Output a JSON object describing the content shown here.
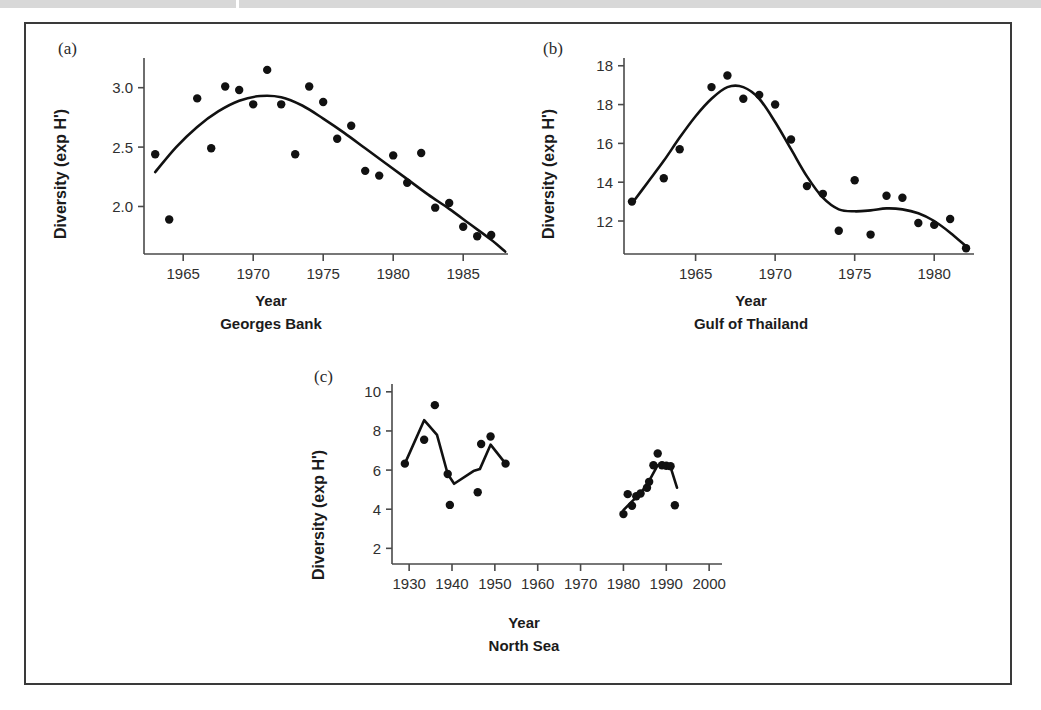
{
  "figure": {
    "panels": [
      "a",
      "b",
      "c"
    ],
    "axis_title": "Year",
    "y_axis_label": "Diversity (exp H')"
  },
  "panel_a": {
    "letter": "(a)",
    "caption": "Georges Bank",
    "xlabel": "Year",
    "ylabel": "Diversity (exp H')",
    "xticks": [
      "1965",
      "1970",
      "1975",
      "1980",
      "1985"
    ],
    "yticks": [
      "3.0",
      "2.5",
      "2.0"
    ]
  },
  "panel_b": {
    "letter": "(b)",
    "caption": "Gulf of Thailand",
    "xlabel": "Year",
    "ylabel": "Diversity (exp H')",
    "xticks": [
      "1965",
      "1970",
      "1975",
      "1980"
    ],
    "yticks": [
      "18",
      "18",
      "16",
      "14",
      "12"
    ]
  },
  "panel_c": {
    "letter": "(c)",
    "caption": "North Sea",
    "xlabel": "Year",
    "ylabel": "Diversity (exp H')",
    "xticks": [
      "1930",
      "1940",
      "1950",
      "1960",
      "1970",
      "1980",
      "1990",
      "2000"
    ],
    "yticks": [
      "10",
      "8",
      "6",
      "4",
      "2"
    ]
  },
  "chart_data": [
    {
      "type": "scatter",
      "id": "panel_a",
      "title": "Georges Bank",
      "panel": "(a)",
      "xlabel": "Year",
      "ylabel": "Diversity (exp H')",
      "xlim": [
        1962.2,
        1988.2
      ],
      "ylim": [
        1.6,
        3.25
      ],
      "xticks": [
        1965,
        1970,
        1975,
        1980,
        1985
      ],
      "yticks": [
        3.0,
        2.5,
        2.0
      ],
      "grid": false,
      "legend": "none",
      "points": [
        {
          "x": 1963,
          "y": 2.44
        },
        {
          "x": 1964,
          "y": 1.89
        },
        {
          "x": 1966,
          "y": 2.91
        },
        {
          "x": 1967,
          "y": 2.49
        },
        {
          "x": 1968,
          "y": 3.01
        },
        {
          "x": 1969,
          "y": 2.98
        },
        {
          "x": 1970,
          "y": 2.86
        },
        {
          "x": 1971,
          "y": 3.15
        },
        {
          "x": 1972,
          "y": 2.86
        },
        {
          "x": 1973,
          "y": 2.44
        },
        {
          "x": 1974,
          "y": 3.01
        },
        {
          "x": 1975,
          "y": 2.88
        },
        {
          "x": 1976,
          "y": 2.57
        },
        {
          "x": 1977,
          "y": 2.68
        },
        {
          "x": 1978,
          "y": 2.3
        },
        {
          "x": 1979,
          "y": 2.26
        },
        {
          "x": 1980,
          "y": 2.43
        },
        {
          "x": 1981,
          "y": 2.2
        },
        {
          "x": 1982,
          "y": 2.45
        },
        {
          "x": 1983,
          "y": 1.99
        },
        {
          "x": 1984,
          "y": 2.03
        },
        {
          "x": 1985,
          "y": 1.83
        },
        {
          "x": 1986,
          "y": 1.75
        },
        {
          "x": 1987,
          "y": 1.76
        }
      ],
      "trend": [
        {
          "x": 1963.0,
          "y": 2.29
        },
        {
          "x": 1964.5,
          "y": 2.5
        },
        {
          "x": 1966.0,
          "y": 2.67
        },
        {
          "x": 1967.5,
          "y": 2.8
        },
        {
          "x": 1969.0,
          "y": 2.89
        },
        {
          "x": 1970.5,
          "y": 2.93
        },
        {
          "x": 1972.0,
          "y": 2.92
        },
        {
          "x": 1973.5,
          "y": 2.85
        },
        {
          "x": 1975.0,
          "y": 2.74
        },
        {
          "x": 1976.5,
          "y": 2.62
        },
        {
          "x": 1978.0,
          "y": 2.49
        },
        {
          "x": 1979.5,
          "y": 2.36
        },
        {
          "x": 1981.0,
          "y": 2.23
        },
        {
          "x": 1982.5,
          "y": 2.1
        },
        {
          "x": 1984.0,
          "y": 1.98
        },
        {
          "x": 1985.5,
          "y": 1.85
        },
        {
          "x": 1987.0,
          "y": 1.72
        },
        {
          "x": 1988.0,
          "y": 1.62
        }
      ]
    },
    {
      "type": "scatter",
      "id": "panel_b",
      "title": "Gulf of Thailand",
      "panel": "(b)",
      "xlabel": "Year",
      "ylabel": "Diversity (exp H')",
      "xlim": [
        1960.5,
        1982.5
      ],
      "ylim": [
        10.3,
        20.4
      ],
      "xticks": [
        1965,
        1970,
        1975,
        1980
      ],
      "yticks": [
        20,
        18,
        16,
        14,
        12
      ],
      "grid": false,
      "legend": "none",
      "points": [
        {
          "x": 1961,
          "y": 13.0
        },
        {
          "x": 1963,
          "y": 14.2
        },
        {
          "x": 1964,
          "y": 15.7
        },
        {
          "x": 1966,
          "y": 18.9
        },
        {
          "x": 1967,
          "y": 19.5
        },
        {
          "x": 1968,
          "y": 18.3
        },
        {
          "x": 1969,
          "y": 18.5
        },
        {
          "x": 1970,
          "y": 18.0
        },
        {
          "x": 1971,
          "y": 16.2
        },
        {
          "x": 1972,
          "y": 13.8
        },
        {
          "x": 1973,
          "y": 13.4
        },
        {
          "x": 1974,
          "y": 11.5
        },
        {
          "x": 1975,
          "y": 14.1
        },
        {
          "x": 1976,
          "y": 11.3
        },
        {
          "x": 1977,
          "y": 13.3
        },
        {
          "x": 1978,
          "y": 13.2
        },
        {
          "x": 1979,
          "y": 11.9
        },
        {
          "x": 1980,
          "y": 11.8
        },
        {
          "x": 1981,
          "y": 12.1
        },
        {
          "x": 1982,
          "y": 10.6
        }
      ],
      "trend": [
        {
          "x": 1961.0,
          "y": 12.9
        },
        {
          "x": 1962.0,
          "y": 14.0
        },
        {
          "x": 1963.0,
          "y": 15.1
        },
        {
          "x": 1964.0,
          "y": 16.3
        },
        {
          "x": 1965.0,
          "y": 17.4
        },
        {
          "x": 1966.0,
          "y": 18.3
        },
        {
          "x": 1967.0,
          "y": 18.9
        },
        {
          "x": 1968.0,
          "y": 18.9
        },
        {
          "x": 1969.0,
          "y": 18.3
        },
        {
          "x": 1970.0,
          "y": 17.1
        },
        {
          "x": 1971.0,
          "y": 15.7
        },
        {
          "x": 1972.0,
          "y": 14.3
        },
        {
          "x": 1973.0,
          "y": 13.2
        },
        {
          "x": 1974.0,
          "y": 12.6
        },
        {
          "x": 1975.0,
          "y": 12.5
        },
        {
          "x": 1976.0,
          "y": 12.55
        },
        {
          "x": 1977.0,
          "y": 12.65
        },
        {
          "x": 1978.0,
          "y": 12.6
        },
        {
          "x": 1979.0,
          "y": 12.4
        },
        {
          "x": 1980.0,
          "y": 12.0
        },
        {
          "x": 1981.0,
          "y": 11.4
        },
        {
          "x": 1982.0,
          "y": 10.7
        }
      ]
    },
    {
      "type": "scatter",
      "id": "panel_c",
      "title": "North Sea",
      "panel": "(c)",
      "xlabel": "Year",
      "ylabel": "Diversity (exp H')",
      "xlim": [
        1926,
        2003
      ],
      "ylim": [
        1.2,
        10.4
      ],
      "xticks": [
        1930,
        1940,
        1950,
        1960,
        1970,
        1980,
        1990,
        2000
      ],
      "yticks": [
        10,
        8,
        6,
        4,
        2
      ],
      "grid": false,
      "legend": "none",
      "points": [
        {
          "x": 1929,
          "y": 6.33
        },
        {
          "x": 1933.5,
          "y": 7.55
        },
        {
          "x": 1936,
          "y": 9.32
        },
        {
          "x": 1939,
          "y": 5.8
        },
        {
          "x": 1939.5,
          "y": 4.22
        },
        {
          "x": 1946,
          "y": 4.87
        },
        {
          "x": 1946.8,
          "y": 7.33
        },
        {
          "x": 1949,
          "y": 7.72
        },
        {
          "x": 1952.5,
          "y": 6.33
        },
        {
          "x": 1980,
          "y": 3.75
        },
        {
          "x": 1981,
          "y": 4.77
        },
        {
          "x": 1982,
          "y": 4.18
        },
        {
          "x": 1983,
          "y": 4.66
        },
        {
          "x": 1984,
          "y": 4.8
        },
        {
          "x": 1985.5,
          "y": 5.1
        },
        {
          "x": 1986,
          "y": 5.4
        },
        {
          "x": 1987,
          "y": 6.25
        },
        {
          "x": 1988,
          "y": 6.85
        },
        {
          "x": 1989,
          "y": 6.25
        },
        {
          "x": 1990,
          "y": 6.22
        },
        {
          "x": 1991,
          "y": 6.2
        },
        {
          "x": 1992,
          "y": 4.2
        }
      ],
      "trend_early": [
        {
          "x": 1929,
          "y": 6.33
        },
        {
          "x": 1933.5,
          "y": 8.55
        },
        {
          "x": 1936.5,
          "y": 7.8
        },
        {
          "x": 1939,
          "y": 5.8
        },
        {
          "x": 1940.5,
          "y": 5.3
        },
        {
          "x": 1945,
          "y": 5.95
        },
        {
          "x": 1946.5,
          "y": 6.05
        },
        {
          "x": 1949,
          "y": 7.3
        },
        {
          "x": 1952.5,
          "y": 6.33
        }
      ],
      "trend_late": [
        {
          "x": 1980,
          "y": 3.95
        },
        {
          "x": 1982,
          "y": 4.4
        },
        {
          "x": 1984,
          "y": 4.8
        },
        {
          "x": 1986,
          "y": 5.45
        },
        {
          "x": 1988,
          "y": 6.25
        },
        {
          "x": 1989.5,
          "y": 6.3
        },
        {
          "x": 1991,
          "y": 6.15
        },
        {
          "x": 1992.5,
          "y": 5.1
        }
      ]
    }
  ]
}
